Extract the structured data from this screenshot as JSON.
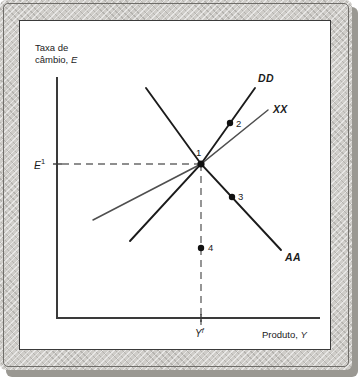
{
  "figure": {
    "axes": {
      "y_title_line1": "Taxa de",
      "y_title_line2_prefix": "câmbio, ",
      "y_title_line2_var": "E",
      "x_title_prefix": "Produto, ",
      "x_title_var": "Y",
      "y_tick_label": "E",
      "y_tick_sup": "1",
      "x_tick_label": "Y",
      "x_tick_sup": "f"
    },
    "curves": [
      {
        "name": "DD",
        "label": "DD",
        "color": "#1b1b1b",
        "width": 1.9
      },
      {
        "name": "XX",
        "label": "XX",
        "color": "#4f4f4f",
        "width": 1.5
      },
      {
        "name": "AA",
        "label": "AA",
        "color": "#1b1b1b",
        "width": 1.9
      }
    ],
    "points": [
      {
        "id": "1",
        "label": "1",
        "x": 201,
        "y": 164
      },
      {
        "id": "2",
        "label": "2",
        "x": 230,
        "y": 123
      },
      {
        "id": "3",
        "label": "3",
        "x": 232,
        "y": 197
      },
      {
        "id": "4",
        "label": "4",
        "x": 201,
        "y": 248
      }
    ],
    "colors": {
      "axis": "#3a3a3a",
      "dashed": "#6a6a6a",
      "plate": "#ffffff",
      "texture": "#cfcdc9"
    }
  }
}
